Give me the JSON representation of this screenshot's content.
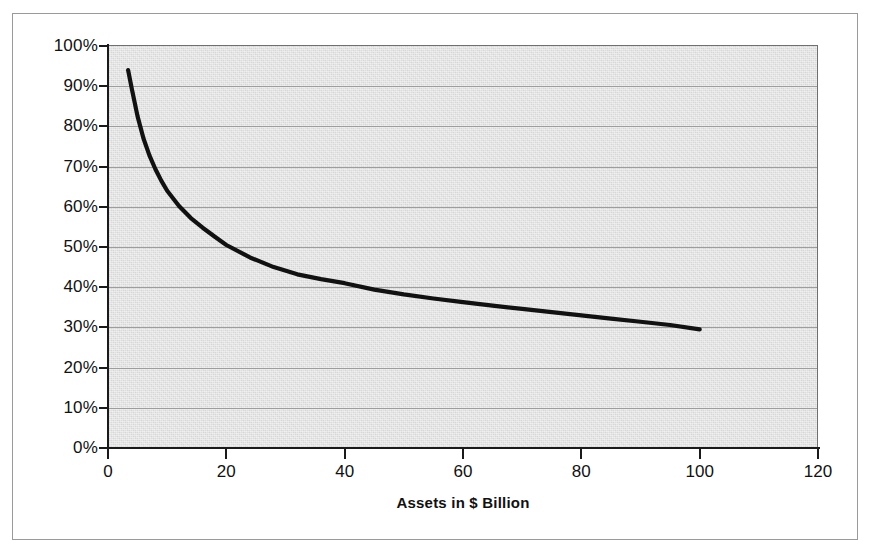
{
  "figure": {
    "background_color": "#ffffff",
    "frame_color": "#9a9a9a",
    "plot_background_color": "#d6d6d6",
    "gridline_color": "#9d9d9d",
    "axis_color": "#1a1a1a",
    "series_color": "#111111"
  },
  "chart_data": {
    "type": "line",
    "title": "",
    "subtitle": "",
    "xlabel": "Assets in $ Billion",
    "ylabel": "",
    "xlim": [
      0,
      120
    ],
    "ylim": [
      0,
      100
    ],
    "grid": "horizontal",
    "legend": "none",
    "x_ticks": [
      0,
      20,
      40,
      60,
      80,
      100,
      120
    ],
    "x_tick_labels": [
      "0",
      "20",
      "40",
      "60",
      "80",
      "100",
      "120"
    ],
    "y_ticks": [
      0,
      10,
      20,
      30,
      40,
      50,
      60,
      70,
      80,
      90,
      100
    ],
    "y_tick_labels": [
      "0%",
      "10%",
      "20%",
      "30%",
      "40%",
      "50%",
      "60%",
      "70%",
      "80%",
      "90%",
      "100%"
    ],
    "series": [
      {
        "name": "",
        "x": [
          3.4,
          4,
          5,
          6,
          7,
          8,
          9,
          10,
          12,
          14,
          16,
          18,
          20,
          24,
          28,
          32,
          36,
          40,
          45,
          50,
          55,
          60,
          65,
          70,
          75,
          80,
          85,
          90,
          95,
          100
        ],
        "values": [
          94.0,
          89.5,
          82.5,
          77.0,
          72.8,
          69.4,
          66.5,
          64.0,
          60.2,
          57.2,
          54.8,
          52.6,
          50.5,
          47.4,
          45.0,
          43.2,
          42.0,
          41.0,
          39.4,
          38.2,
          37.2,
          36.3,
          35.4,
          34.6,
          33.8,
          33.0,
          32.2,
          31.4,
          30.6,
          29.5
        ]
      }
    ]
  }
}
